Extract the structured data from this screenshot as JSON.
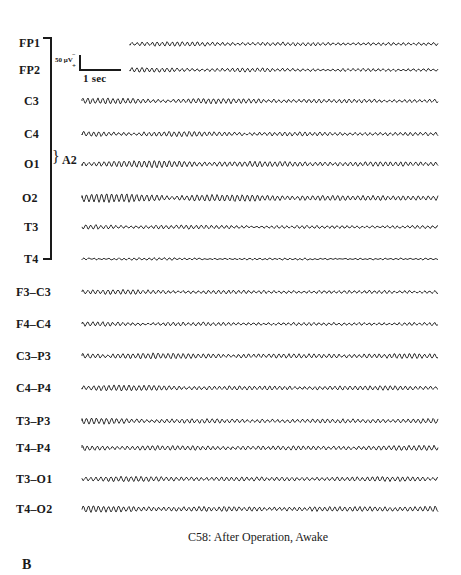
{
  "figure": {
    "caption": "C58: After Operation, Awake",
    "panel_letter": "B",
    "reference_label": "A2",
    "calibration": {
      "amplitude_label": "50 μV",
      "polarity_minus": "−",
      "polarity_plus": "+",
      "time_label": "1 sec"
    },
    "referential_channels": [
      {
        "label": "FP1",
        "y": 43
      },
      {
        "label": "FP2",
        "y": 69
      },
      {
        "label": "C3",
        "y": 100
      },
      {
        "label": "C4",
        "y": 133
      },
      {
        "label": "O1",
        "y": 163
      },
      {
        "label": "O2",
        "y": 197
      },
      {
        "label": "T3",
        "y": 226
      },
      {
        "label": "T4",
        "y": 258
      }
    ],
    "bipolar_channels": [
      {
        "label": "F3–C3",
        "y": 291
      },
      {
        "label": "F4–C4",
        "y": 323
      },
      {
        "label": "C3–P3",
        "y": 355
      },
      {
        "label": "C4–P4",
        "y": 387
      },
      {
        "label": "T3–P3",
        "y": 420
      },
      {
        "label": "T4–P4",
        "y": 447
      },
      {
        "label": "T3–O1",
        "y": 478
      },
      {
        "label": "T4–O2",
        "y": 508
      }
    ]
  }
}
